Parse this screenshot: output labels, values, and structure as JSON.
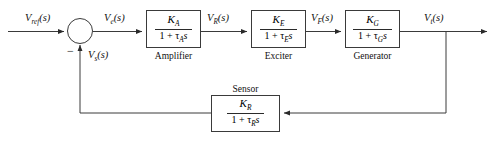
{
  "diagram": {
    "type": "control-system-block-diagram",
    "background_color": "#ffffff",
    "line_color": "#3a3a3a",
    "text_color": "#111111"
  },
  "signals": {
    "reference": "V",
    "reference_sub": "ref",
    "reference_arg": "(s)",
    "error": "V",
    "error_sub": "e",
    "error_arg": "(s)",
    "regulator": "V",
    "regulator_sub": "R",
    "regulator_arg": "(s)",
    "field": "V",
    "field_sub": "F",
    "field_arg": "(s)",
    "terminal": "V",
    "terminal_sub": "t",
    "terminal_arg": "(s)",
    "sensed": "V",
    "sensed_sub": "s",
    "sensed_arg": "(s)"
  },
  "summing_junction": {
    "name": "summing-junction",
    "sign_positive_input": "reference",
    "sign_negative_input": "sensed",
    "negative_sign_glyph": "−"
  },
  "blocks": [
    {
      "id": "amplifier",
      "label": "Amplifier",
      "numerator": "K",
      "numerator_sub": "A",
      "denominator_one": "1 +",
      "denominator_tau": "τ",
      "denominator_tau_sub": "A",
      "denominator_s": "s"
    },
    {
      "id": "exciter",
      "label": "Exciter",
      "numerator": "K",
      "numerator_sub": "E",
      "denominator_one": "1 +",
      "denominator_tau": "τ",
      "denominator_tau_sub": "E",
      "denominator_s": "s"
    },
    {
      "id": "generator",
      "label": "Generator",
      "numerator": "K",
      "numerator_sub": "G",
      "denominator_one": "1 +",
      "denominator_tau": "τ",
      "denominator_tau_sub": "G",
      "denominator_s": "s"
    },
    {
      "id": "sensor",
      "label": "Sensor",
      "numerator": "K",
      "numerator_sub": "R",
      "denominator_one": "1 +",
      "denominator_tau": "τ",
      "denominator_tau_sub": "R",
      "denominator_s": "s"
    }
  ]
}
